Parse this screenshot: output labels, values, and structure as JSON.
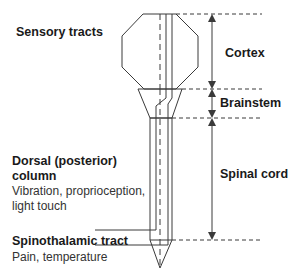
{
  "labels": {
    "sensory_tracts": "Sensory tracts",
    "cortex": "Cortex",
    "brainstem": "Brainstem",
    "spinal_cord": "Spinal cord",
    "dorsal_column_line1": "Dorsal (posterior)",
    "dorsal_column_line2": "column",
    "dorsal_column_desc1": "Vibration, proprioception,",
    "dorsal_column_desc2": "light touch",
    "spinothalamic_title": "Spinothalamic tract",
    "spinothalamic_desc": "Pain, temperature"
  },
  "colors": {
    "stroke": "#3a3a3a",
    "text": "#1a1a1a",
    "background": "#ffffff"
  }
}
